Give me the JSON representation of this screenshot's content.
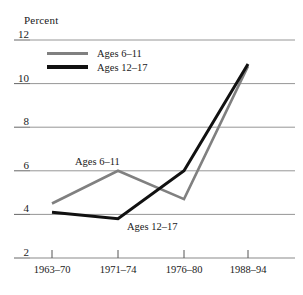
{
  "chart_data": {
    "type": "line",
    "title": "",
    "ylabel": "Percent",
    "xlabel": "",
    "categories": [
      "1963–70",
      "1971–74",
      "1976–80",
      "1988–94"
    ],
    "ylim": [
      2,
      12
    ],
    "yticks": [
      12,
      10,
      8,
      6,
      4,
      2
    ],
    "grid": true,
    "legend_position": "top-left",
    "series": [
      {
        "name": "Ages 6–11",
        "color": "#808080",
        "values": [
          4.5,
          6.0,
          4.7,
          10.8
        ]
      },
      {
        "name": "Ages 12–17",
        "color": "#111111",
        "values": [
          4.1,
          3.8,
          6.0,
          10.9
        ]
      }
    ],
    "annotations": [
      {
        "text": "Ages 6–11",
        "x": 75,
        "y": 156
      },
      {
        "text": "Ages 12–17",
        "x": 127,
        "y": 221
      }
    ]
  },
  "axis": {
    "y_title": "Percent",
    "y_labels": [
      "12",
      "10",
      "8",
      "6",
      "4",
      "2"
    ],
    "x_labels": [
      "1963–70",
      "1971–74",
      "1976–80",
      "1988–94"
    ]
  },
  "legend": {
    "items": [
      {
        "label": "Ages 6–11",
        "color": "#808080"
      },
      {
        "label": "Ages 12–17",
        "color": "#111111"
      }
    ]
  },
  "colors": {
    "gridline": "#8a8a8a",
    "axis": "#555555",
    "series_gray": "#808080",
    "series_black": "#111111",
    "background": "#ffffff"
  }
}
